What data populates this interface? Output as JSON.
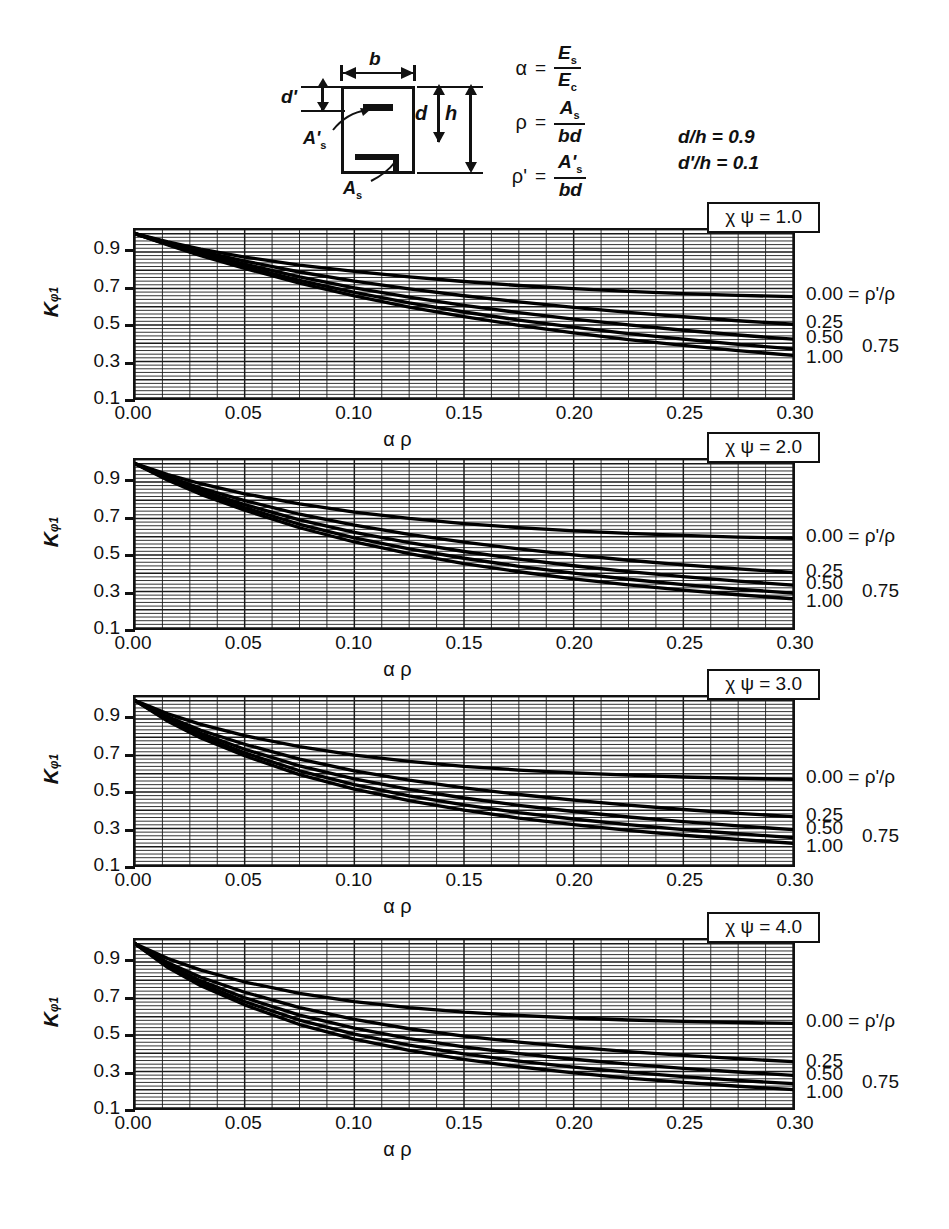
{
  "figure": {
    "section_diagram": {
      "label_b": "b",
      "label_d_prime": "d'",
      "label_d": "d",
      "label_h": "h",
      "label_As_prime": "A's",
      "label_As": "As"
    },
    "formulas": [
      {
        "symbol": "α",
        "eq": "=",
        "numerator": "E",
        "num_sub": "s",
        "denominator": "E",
        "den_sub": "c"
      },
      {
        "symbol": "ρ",
        "eq": "=",
        "numerator": "A",
        "num_sub": "s",
        "denominator": "bd",
        "den_sub": ""
      },
      {
        "symbol": "ρ'",
        "eq": "=",
        "numerator": "A'",
        "num_sub": "s",
        "denominator": "bd",
        "den_sub": ""
      }
    ],
    "ratios": {
      "line1": "d/h = 0.9",
      "line2": "d'/h = 0.1"
    }
  },
  "axes": {
    "y_label_main": "K",
    "y_label_sub": "φ1",
    "y_ticks": [
      "0.9",
      "0.7",
      "0.5",
      "0.3",
      "0.1"
    ],
    "y_tick_values": [
      0.9,
      0.7,
      0.5,
      0.3,
      0.1
    ],
    "y_min": 0.1,
    "y_max": 1.02,
    "x_ticks": [
      "0.00",
      "0.05",
      "0.10",
      "0.15",
      "0.20",
      "0.25",
      "0.30"
    ],
    "x_tick_values": [
      0.0,
      0.05,
      0.1,
      0.15,
      0.2,
      0.25,
      0.3
    ],
    "x_min": 0.0,
    "x_max": 0.3,
    "x_label_alpha": "α",
    "x_label_rho": "ρ",
    "grid": "fine rectangular grid, minor x every 0.0125, minor y every 0.02"
  },
  "chart_data": [
    {
      "type": "line",
      "title": "χ ψ = 1.0",
      "xlabel": "α ρ",
      "ylabel": "Kφ1",
      "xlim": [
        0.0,
        0.3
      ],
      "ylim": [
        0.1,
        1.02
      ],
      "x": [
        0.0,
        0.015,
        0.03,
        0.05,
        0.075,
        0.1,
        0.125,
        0.15,
        0.175,
        0.2,
        0.225,
        0.25,
        0.275,
        0.3
      ],
      "series": [
        {
          "name": "0.00",
          "label": "0.00 = ρ'/ρ",
          "values": [
            1.0,
            0.955,
            0.915,
            0.872,
            0.828,
            0.793,
            0.763,
            0.738,
            0.716,
            0.699,
            0.684,
            0.672,
            0.662,
            0.655
          ]
        },
        {
          "name": "0.25",
          "label": "0.25",
          "values": [
            1.0,
            0.95,
            0.903,
            0.85,
            0.79,
            0.74,
            0.698,
            0.66,
            0.626,
            0.596,
            0.569,
            0.545,
            0.523,
            0.504
          ]
        },
        {
          "name": "0.50",
          "label": "0.50",
          "values": [
            1.0,
            0.945,
            0.893,
            0.833,
            0.763,
            0.703,
            0.652,
            0.607,
            0.567,
            0.532,
            0.5,
            0.471,
            0.445,
            0.422
          ]
        },
        {
          "name": "0.75",
          "label": "0.75",
          "values": [
            1.0,
            0.941,
            0.885,
            0.82,
            0.744,
            0.678,
            0.621,
            0.571,
            0.527,
            0.488,
            0.453,
            0.422,
            0.394,
            0.369
          ]
        },
        {
          "name": "1.00",
          "label": "1.00",
          "values": [
            1.0,
            0.938,
            0.879,
            0.81,
            0.729,
            0.659,
            0.598,
            0.545,
            0.498,
            0.457,
            0.42,
            0.388,
            0.359,
            0.333
          ]
        }
      ],
      "right_labels": [
        {
          "text": "0.00 = ρ'/ρ",
          "value": 0.655
        },
        {
          "text": "0.25",
          "value": 0.504
        },
        {
          "text": "0.50",
          "value": 0.422
        },
        {
          "text": "0.75",
          "value": 0.369
        },
        {
          "text": "1.00",
          "value": 0.333
        }
      ]
    },
    {
      "type": "line",
      "title": "χ ψ = 2.0",
      "xlabel": "α ρ",
      "ylabel": "Kφ1",
      "xlim": [
        0.0,
        0.3
      ],
      "ylim": [
        0.1,
        1.02
      ],
      "x": [
        0.0,
        0.015,
        0.03,
        0.05,
        0.075,
        0.1,
        0.125,
        0.15,
        0.175,
        0.2,
        0.225,
        0.25,
        0.275,
        0.3
      ],
      "series": [
        {
          "name": "0.00",
          "label": "0.00 = ρ'/ρ",
          "values": [
            1.0,
            0.94,
            0.89,
            0.835,
            0.78,
            0.735,
            0.7,
            0.672,
            0.65,
            0.632,
            0.618,
            0.607,
            0.598,
            0.591
          ]
        },
        {
          "name": "0.25",
          "label": "0.25",
          "values": [
            1.0,
            0.928,
            0.866,
            0.798,
            0.723,
            0.663,
            0.613,
            0.57,
            0.533,
            0.5,
            0.471,
            0.446,
            0.424,
            0.404
          ]
        },
        {
          "name": "0.50",
          "label": "0.50",
          "values": [
            1.0,
            0.92,
            0.852,
            0.776,
            0.692,
            0.624,
            0.567,
            0.519,
            0.477,
            0.441,
            0.409,
            0.381,
            0.357,
            0.335
          ]
        },
        {
          "name": "0.75",
          "label": "0.75",
          "values": [
            1.0,
            0.914,
            0.841,
            0.759,
            0.668,
            0.594,
            0.533,
            0.482,
            0.438,
            0.4,
            0.367,
            0.338,
            0.313,
            0.291
          ]
        },
        {
          "name": "1.00",
          "label": "1.00",
          "values": [
            1.0,
            0.909,
            0.832,
            0.745,
            0.649,
            0.571,
            0.507,
            0.453,
            0.408,
            0.369,
            0.336,
            0.307,
            0.282,
            0.26
          ]
        }
      ],
      "right_labels": [
        {
          "text": "0.00 = ρ'/ρ",
          "value": 0.591
        },
        {
          "text": "0.25",
          "value": 0.404
        },
        {
          "text": "0.50",
          "value": 0.335
        },
        {
          "text": "0.75",
          "value": 0.291
        },
        {
          "text": "1.00",
          "value": 0.26
        }
      ]
    },
    {
      "type": "line",
      "title": "χ ψ = 3.0",
      "xlabel": "α ρ",
      "ylabel": "Kφ1",
      "xlim": [
        0.0,
        0.3
      ],
      "ylim": [
        0.1,
        1.02
      ],
      "x": [
        0.0,
        0.015,
        0.03,
        0.05,
        0.075,
        0.1,
        0.125,
        0.15,
        0.175,
        0.2,
        0.225,
        0.25,
        0.275,
        0.3
      ],
      "series": [
        {
          "name": "0.00",
          "label": "0.00 = ρ'/ρ",
          "values": [
            1.0,
            0.928,
            0.87,
            0.808,
            0.748,
            0.702,
            0.667,
            0.64,
            0.62,
            0.604,
            0.592,
            0.582,
            0.575,
            0.569
          ]
        },
        {
          "name": "0.25",
          "label": "0.25",
          "values": [
            1.0,
            0.911,
            0.838,
            0.761,
            0.68,
            0.616,
            0.565,
            0.522,
            0.486,
            0.455,
            0.428,
            0.404,
            0.383,
            0.365
          ]
        },
        {
          "name": "0.50",
          "label": "0.50",
          "values": [
            1.0,
            0.901,
            0.821,
            0.734,
            0.643,
            0.572,
            0.514,
            0.467,
            0.427,
            0.393,
            0.363,
            0.337,
            0.314,
            0.294
          ]
        },
        {
          "name": "0.75",
          "label": "0.75",
          "values": [
            1.0,
            0.893,
            0.807,
            0.714,
            0.616,
            0.54,
            0.479,
            0.429,
            0.387,
            0.352,
            0.321,
            0.294,
            0.271,
            0.25
          ]
        },
        {
          "name": "1.00",
          "label": "1.00",
          "values": [
            1.0,
            0.887,
            0.796,
            0.698,
            0.595,
            0.515,
            0.452,
            0.4,
            0.357,
            0.321,
            0.29,
            0.263,
            0.24,
            0.219
          ]
        }
      ],
      "right_labels": [
        {
          "text": "0.00 = ρ'/ρ",
          "value": 0.569
        },
        {
          "text": "0.25",
          "value": 0.365
        },
        {
          "text": "0.50",
          "value": 0.294
        },
        {
          "text": "0.75",
          "value": 0.25
        },
        {
          "text": "1.00",
          "value": 0.219
        }
      ]
    },
    {
      "type": "line",
      "title": "χ ψ = 4.0",
      "xlabel": "α ρ",
      "ylabel": "Kφ1",
      "xlim": [
        0.0,
        0.3
      ],
      "ylim": [
        0.1,
        1.02
      ],
      "x": [
        0.0,
        0.015,
        0.03,
        0.05,
        0.075,
        0.1,
        0.125,
        0.15,
        0.175,
        0.2,
        0.225,
        0.25,
        0.275,
        0.3
      ],
      "series": [
        {
          "name": "0.00",
          "label": "0.00 = ρ'/ρ",
          "values": [
            1.0,
            0.918,
            0.855,
            0.79,
            0.728,
            0.683,
            0.65,
            0.625,
            0.607,
            0.593,
            0.582,
            0.574,
            0.568,
            0.563
          ]
        },
        {
          "name": "0.25",
          "label": "0.25",
          "values": [
            1.0,
            0.896,
            0.816,
            0.734,
            0.65,
            0.585,
            0.534,
            0.494,
            0.461,
            0.433,
            0.409,
            0.388,
            0.37,
            0.354
          ]
        },
        {
          "name": "0.50",
          "label": "0.50",
          "values": [
            1.0,
            0.884,
            0.796,
            0.704,
            0.609,
            0.537,
            0.48,
            0.435,
            0.398,
            0.367,
            0.34,
            0.317,
            0.297,
            0.279
          ]
        },
        {
          "name": "0.75",
          "label": "0.75",
          "values": [
            1.0,
            0.876,
            0.781,
            0.683,
            0.581,
            0.504,
            0.444,
            0.396,
            0.357,
            0.324,
            0.296,
            0.272,
            0.251,
            0.233
          ]
        },
        {
          "name": "1.00",
          "label": "1.00",
          "values": [
            1.0,
            0.869,
            0.769,
            0.665,
            0.557,
            0.477,
            0.415,
            0.366,
            0.326,
            0.292,
            0.264,
            0.24,
            0.219,
            0.201
          ]
        }
      ],
      "right_labels": [
        {
          "text": "0.00 = ρ'/ρ",
          "value": 0.563
        },
        {
          "text": "0.25",
          "value": 0.354
        },
        {
          "text": "0.50",
          "value": 0.279
        },
        {
          "text": "0.75",
          "value": 0.233
        },
        {
          "text": "1.00",
          "value": 0.201
        }
      ]
    }
  ],
  "layout": {
    "chart_tops": [
      228,
      458,
      695,
      938
    ],
    "colors": {
      "ink": "#111111",
      "grid": "#222222",
      "paper": "#ffffff"
    }
  }
}
